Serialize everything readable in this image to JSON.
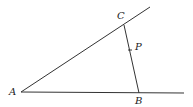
{
  "diagram": {
    "type": "geometry",
    "points": {
      "A": {
        "label": "A",
        "x": 21,
        "y": 92
      },
      "B": {
        "label": "B",
        "x": 139,
        "y": 93
      },
      "C": {
        "label": "C",
        "x": 124,
        "y": 25
      },
      "P": {
        "label": "P",
        "x": 130,
        "y": 50
      }
    },
    "segments": [
      {
        "from": "A",
        "to": "ray-end-upper",
        "desc": "ray from A through C"
      },
      {
        "from": "A",
        "to": "ray-end-horizontal",
        "desc": "ray from A through B"
      },
      {
        "from": "C",
        "to": "B",
        "desc": "segment CB with point P"
      }
    ],
    "stroke_color": "#333333"
  }
}
